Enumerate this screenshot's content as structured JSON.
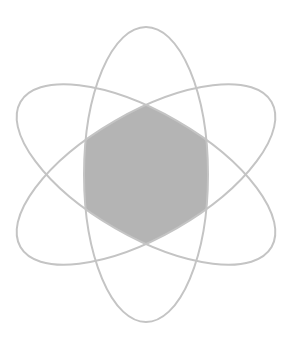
{
  "diagram": {
    "type": "venn-atom",
    "canvas": {
      "width": 292,
      "height": 346,
      "background": "#ffffff"
    },
    "center": {
      "x": 146,
      "y": 174.5
    },
    "ellipses": [
      {
        "id": "vertical",
        "rx": 62,
        "ry": 147.5,
        "rotation": 0
      },
      {
        "id": "tilted-right",
        "rx": 62,
        "ry": 145,
        "rotation": 60
      },
      {
        "id": "tilted-left",
        "rx": 62,
        "ry": 145,
        "rotation": -60
      }
    ],
    "style": {
      "stroke_color": "#c4c4c4",
      "stroke_width": 2,
      "fill_color": "#b4b4b4"
    },
    "shaded_region": "intersection-of-all-three-ellipses",
    "caption": ""
  }
}
